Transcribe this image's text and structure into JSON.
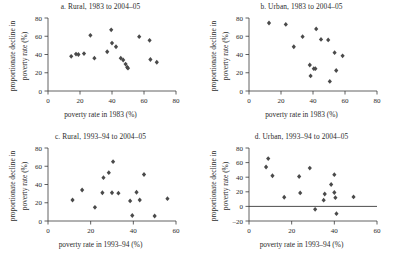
{
  "figure": {
    "marker_color": "#4a4a4a",
    "axis_color": "#3a3a3a",
    "background": "#ffffff"
  },
  "chart_data": [
    {
      "type": "scatter",
      "panel": "a",
      "title": "a. Rural, 1983 to 2004–05",
      "xlabel": "poverty rate in 1983 (%)",
      "ylabel_line1": "proportionate decline in",
      "ylabel_line2": "poverty rate (%)",
      "xlim": [
        0,
        80
      ],
      "ylim": [
        0,
        80
      ],
      "xticks": [
        0,
        20,
        40,
        60,
        80
      ],
      "yticks": [
        0,
        20,
        40,
        60,
        80
      ],
      "grid": false,
      "legend": "none",
      "points": [
        {
          "x": 14.5,
          "y": 38
        },
        {
          "x": 17.5,
          "y": 40.5
        },
        {
          "x": 19.0,
          "y": 40.0
        },
        {
          "x": 22.5,
          "y": 41.0
        },
        {
          "x": 26.5,
          "y": 61.0
        },
        {
          "x": 29.0,
          "y": 36.0
        },
        {
          "x": 37.0,
          "y": 43.0
        },
        {
          "x": 39.5,
          "y": 67.0
        },
        {
          "x": 40.0,
          "y": 52.5
        },
        {
          "x": 42.5,
          "y": 48.5
        },
        {
          "x": 45.5,
          "y": 36.0
        },
        {
          "x": 47.0,
          "y": 34.0
        },
        {
          "x": 48.5,
          "y": 29.5
        },
        {
          "x": 49.5,
          "y": 26.0
        },
        {
          "x": 50.0,
          "y": 25.0
        },
        {
          "x": 57.0,
          "y": 59.5
        },
        {
          "x": 63.5,
          "y": 55.5
        },
        {
          "x": 64.0,
          "y": 34.5
        },
        {
          "x": 68.0,
          "y": 31.5
        }
      ]
    },
    {
      "type": "scatter",
      "panel": "b",
      "title": "b. Urban, 1983 to 2004–05",
      "xlabel": "poverty rate in 1983 (%)",
      "ylabel_line1": "proportionate decline in",
      "ylabel_line2": "poverty rate (%)",
      "xlim": [
        0,
        80
      ],
      "ylim": [
        0,
        80
      ],
      "xticks": [
        0,
        20,
        40,
        60,
        80
      ],
      "yticks": [
        0,
        20,
        40,
        60,
        80
      ],
      "grid": false,
      "legend": "none",
      "points": [
        {
          "x": 12.5,
          "y": 74.5
        },
        {
          "x": 23.0,
          "y": 73.0
        },
        {
          "x": 28.0,
          "y": 48.5
        },
        {
          "x": 33.5,
          "y": 59.5
        },
        {
          "x": 38.0,
          "y": 28.5
        },
        {
          "x": 38.5,
          "y": 16.5
        },
        {
          "x": 40.5,
          "y": 24.5
        },
        {
          "x": 41.5,
          "y": 24.5
        },
        {
          "x": 42.0,
          "y": 68.0
        },
        {
          "x": 45.0,
          "y": 56.5
        },
        {
          "x": 49.5,
          "y": 56.0
        },
        {
          "x": 50.5,
          "y": 10.5
        },
        {
          "x": 53.5,
          "y": 42.0
        },
        {
          "x": 54.5,
          "y": 22.5
        },
        {
          "x": 58.5,
          "y": 38.5
        }
      ]
    },
    {
      "type": "scatter",
      "panel": "c",
      "title": "c. Rural, 1993–94 to 2004–05",
      "xlabel": "poverty rate in 1993–94 (%)",
      "ylabel_line1": "proportionate decline in",
      "ylabel_line2": "poverty rate (%)",
      "xlim": [
        0,
        60
      ],
      "ylim": [
        0,
        80
      ],
      "xticks": [
        0,
        20,
        40,
        60
      ],
      "yticks": [
        0,
        20,
        40,
        60,
        80
      ],
      "grid": false,
      "legend": "none",
      "points": [
        {
          "x": 11.5,
          "y": 23.0
        },
        {
          "x": 16.0,
          "y": 34.0
        },
        {
          "x": 22.0,
          "y": 15.0
        },
        {
          "x": 25.5,
          "y": 31.0
        },
        {
          "x": 26.0,
          "y": 47.5
        },
        {
          "x": 28.5,
          "y": 53.0
        },
        {
          "x": 30.0,
          "y": 31.0
        },
        {
          "x": 30.5,
          "y": 65.0
        },
        {
          "x": 33.0,
          "y": 30.5
        },
        {
          "x": 38.5,
          "y": 22.0
        },
        {
          "x": 39.5,
          "y": 6.0
        },
        {
          "x": 41.5,
          "y": 31.5
        },
        {
          "x": 43.0,
          "y": 23.0
        },
        {
          "x": 45.0,
          "y": 51.0
        },
        {
          "x": 50.0,
          "y": 5.5
        },
        {
          "x": 56.0,
          "y": 24.5
        }
      ]
    },
    {
      "type": "scatter",
      "panel": "d",
      "title": "d. Urban, 1993–94 to 2004–05",
      "xlabel": "poverty rate in 1993–94 (%)",
      "ylabel_line1": "proportionate decline in",
      "ylabel_line2": "poverty rate (%)",
      "xlim": [
        0,
        60
      ],
      "ylim": [
        -20,
        80
      ],
      "xticks": [
        0,
        20,
        40,
        60
      ],
      "yticks": [
        -20,
        0,
        20,
        40,
        60,
        80
      ],
      "grid": false,
      "zero_line": true,
      "legend": "none",
      "points": [
        {
          "x": 8.0,
          "y": 54.0
        },
        {
          "x": 9.0,
          "y": 65.5
        },
        {
          "x": 11.0,
          "y": 42.0
        },
        {
          "x": 16.5,
          "y": 12.5
        },
        {
          "x": 23.5,
          "y": 41.0
        },
        {
          "x": 24.0,
          "y": 18.5
        },
        {
          "x": 28.5,
          "y": 52.5
        },
        {
          "x": 31.0,
          "y": -4.0
        },
        {
          "x": 35.0,
          "y": 8.5
        },
        {
          "x": 35.5,
          "y": 17.0
        },
        {
          "x": 38.5,
          "y": 30.0
        },
        {
          "x": 40.0,
          "y": 43.5
        },
        {
          "x": 40.0,
          "y": 19.0
        },
        {
          "x": 40.5,
          "y": 12.0
        },
        {
          "x": 41.0,
          "y": -10.0
        },
        {
          "x": 49.0,
          "y": 13.0
        }
      ]
    }
  ]
}
